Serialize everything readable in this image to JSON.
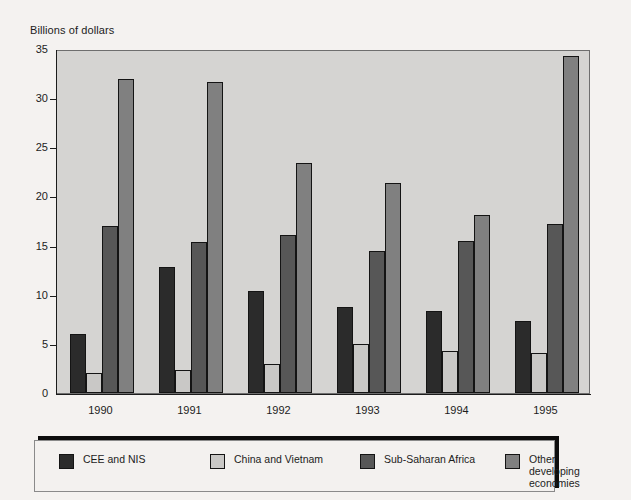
{
  "chart_data": {
    "type": "bar",
    "title": "",
    "ylabel": "Billions of dollars",
    "xlabel": "",
    "ylim": [
      0,
      35
    ],
    "yticks": [
      0,
      5,
      10,
      15,
      20,
      25,
      30,
      35
    ],
    "grid": false,
    "legend_position": "bottom",
    "categories": [
      "1990",
      "1991",
      "1992",
      "1993",
      "1994",
      "1995"
    ],
    "series": [
      {
        "name": "CEE and NIS",
        "color": "#2b2b2b",
        "values": [
          6.0,
          12.8,
          10.4,
          8.8,
          8.3,
          7.3
        ]
      },
      {
        "name": "China and Vietnam",
        "color": "#c9c8c6",
        "values": [
          2.0,
          2.3,
          3.0,
          5.0,
          4.3,
          4.1
        ]
      },
      {
        "name": "Sub-Saharan Africa",
        "color": "#575757",
        "values": [
          17.0,
          15.4,
          16.1,
          14.4,
          15.5,
          17.2
        ]
      },
      {
        "name": "Other developing\neconomies",
        "color": "#808080",
        "values": [
          32.0,
          31.6,
          23.4,
          21.4,
          18.1,
          34.3
        ]
      }
    ]
  },
  "figure": {
    "axis_title": "Billions of dollars",
    "plot_background": "#d5d4d2",
    "page_background": "#f4f2f0",
    "axis_color": "#1c1c1c"
  },
  "legend": {
    "items": [
      {
        "label": "CEE and NIS",
        "color": "#2b2b2b"
      },
      {
        "label": "China and Vietnam",
        "color": "#c9c8c6"
      },
      {
        "label": "Sub-Saharan Africa",
        "color": "#575757"
      },
      {
        "label": "Other developing\neconomies",
        "color": "#808080"
      }
    ]
  }
}
